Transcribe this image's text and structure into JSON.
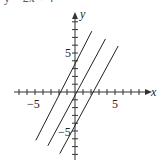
{
  "header": {
    "cut_equation_text": "y = 2x + 4"
  },
  "axes": {
    "x_label": "x",
    "y_label": "y",
    "x_tick_pos_label": "5",
    "x_tick_neg_label": "−5",
    "y_tick_pos_label": "5",
    "y_tick_neg_label": "−5"
  },
  "colors": {
    "axis": "#333333",
    "line": "#222222",
    "background": "#ffffff"
  },
  "chart_data": {
    "type": "line",
    "title": "",
    "xlabel": "x",
    "ylabel": "y",
    "xlim": [
      -7.5,
      9
    ],
    "ylim": [
      -8.5,
      10
    ],
    "grid": false,
    "x_ticks": [
      -7,
      -6,
      -5,
      -4,
      -3,
      -2,
      -1,
      1,
      2,
      3,
      4,
      5,
      6,
      7,
      8
    ],
    "y_ticks": [
      -8,
      -7,
      -6,
      -5,
      -4,
      -3,
      -2,
      -1,
      1,
      2,
      3,
      4,
      5,
      6,
      7,
      8,
      9
    ],
    "tick_labels": {
      "x": [
        "-5",
        "5"
      ],
      "y": [
        "5",
        "-5"
      ]
    },
    "series": [
      {
        "name": "y = 2x + 4",
        "slope": 2,
        "intercept": 4,
        "x": [
          -4.9,
          2.1
        ],
        "y": [
          -6.2,
          7.8
        ]
      },
      {
        "name": "y = 2x",
        "slope": 2,
        "intercept": 0,
        "x": [
          -3.4,
          3.8
        ],
        "y": [
          -6.9,
          6.8
        ]
      },
      {
        "name": "y = 2x - 4",
        "slope": 2,
        "intercept": -4,
        "x": [
          -1.9,
          5.4
        ],
        "y": [
          -7.9,
          5.9
        ]
      }
    ],
    "legend": null
  }
}
